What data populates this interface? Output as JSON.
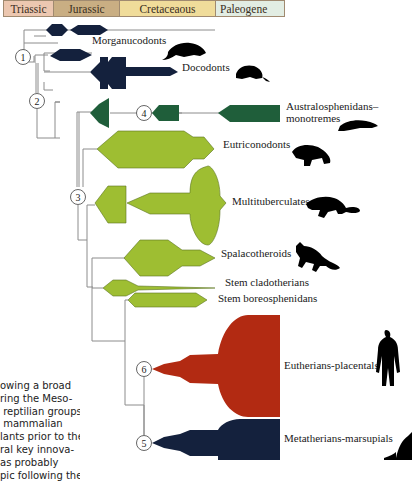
{
  "periods": [
    {
      "label": "Triassic",
      "width": 50,
      "color": "#ecc7b0"
    },
    {
      "label": "Jurassic",
      "width": 66,
      "color": "#c9ae83"
    },
    {
      "label": "Cretaceaous",
      "width": 96,
      "color": "#f0dc9a"
    },
    {
      "label": "Paleogene",
      "width": 68,
      "color": "#e2ede3"
    }
  ],
  "colors": {
    "navy": "#14213d",
    "dark_green": "#1f5e3a",
    "light_green": "#9ebe32",
    "light_green_stroke": "#5a7420",
    "red": "#b22a12",
    "line": "#8c8c8c",
    "silhouette": "#000000"
  },
  "nodes": [
    {
      "id": "1",
      "x": 23,
      "y": 57
    },
    {
      "id": "2",
      "x": 37,
      "y": 101
    },
    {
      "id": "3",
      "x": 78,
      "y": 197
    },
    {
      "id": "4",
      "x": 144,
      "y": 113
    },
    {
      "id": "6",
      "x": 144,
      "y": 369
    },
    {
      "id": "5",
      "x": 144,
      "y": 443
    }
  ],
  "clades": [
    {
      "name": "Morganucodonts",
      "label": "Morganucodonts",
      "x": 92,
      "y": 40,
      "group": "navy"
    },
    {
      "name": "Docodonts",
      "label": "Docodonts",
      "x": 182,
      "y": 67,
      "group": "navy"
    },
    {
      "name": "Australosphenidans-monotremes",
      "label": "Australosphenidans–",
      "label2": "monotremes",
      "x": 286,
      "y": 106,
      "group": "dark_green"
    },
    {
      "name": "Eutriconodonts",
      "label": "Eutriconodonts",
      "x": 223,
      "y": 144,
      "group": "light_green"
    },
    {
      "name": "Multituberculates",
      "label": "Multituberculates",
      "x": 232,
      "y": 201,
      "group": "light_green"
    },
    {
      "name": "Spalacotheroids",
      "label": "Spalacotheroids",
      "x": 221,
      "y": 253,
      "group": "light_green"
    },
    {
      "name": "Stem cladotherians",
      "label": "Stem cladotherians",
      "x": 225,
      "y": 282,
      "group": "light_green"
    },
    {
      "name": "Stem boreosphenidans",
      "label": "Stem boreosphenidans",
      "x": 218,
      "y": 298,
      "group": "light_green"
    },
    {
      "name": "Eutherians-placentals",
      "label": "Eutherians-placentals",
      "x": 284,
      "y": 365,
      "group": "red"
    },
    {
      "name": "Metatherians-marsupials",
      "label": "Metatherians-marsupials",
      "x": 284,
      "y": 438,
      "group": "navy"
    }
  ],
  "silhouettes": [
    {
      "name": "morganucodont",
      "x": 168,
      "y": 40
    },
    {
      "name": "docodont",
      "x": 236,
      "y": 67
    },
    {
      "name": "monotreme",
      "x": 342,
      "y": 120
    },
    {
      "name": "eutriconodont",
      "x": 290,
      "y": 148
    },
    {
      "name": "multituberculate",
      "x": 310,
      "y": 204
    },
    {
      "name": "spalacotheroid",
      "x": 298,
      "y": 260
    },
    {
      "name": "human",
      "x": 380,
      "y": 360
    },
    {
      "name": "marsupial",
      "x": 404,
      "y": 440
    }
  ],
  "caption_lines": [
    "owing a broad",
    "ring the Meso-",
    " reptilian groups,",
    " mammalian",
    "lants prior to the",
    "ral key innova-",
    "as probably",
    "pic following the"
  ]
}
